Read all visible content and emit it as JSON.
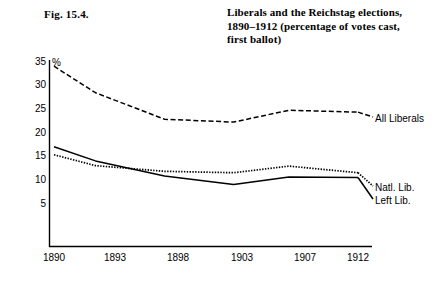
{
  "figure": {
    "number": "Fig. 15.4.",
    "title_lines": [
      "Liberals and the Reichstag elections,",
      "1890–1912 (percentage of votes cast,",
      "first ballot)"
    ]
  },
  "chart_data": {
    "type": "line",
    "title": "Liberals and the Reichstag elections, 1890–1912 (percentage of votes cast, first ballot)",
    "xlabel": "",
    "ylabel": "%",
    "categories": [
      "1890",
      "1893",
      "1898",
      "1903",
      "1907",
      "1912"
    ],
    "x": [
      1890,
      1893,
      1898,
      1903,
      1907,
      1912
    ],
    "ylim": [
      0,
      36
    ],
    "xlim": [
      1888.5,
      1913.5
    ],
    "yticks": [
      5,
      10,
      15,
      20,
      25,
      30,
      35
    ],
    "ytick_labels": [
      "5",
      "10",
      "15",
      "20",
      "25",
      "30",
      "35"
    ],
    "xtick_labels": [
      "1890",
      "1893",
      "1898",
      "1903",
      "1907",
      "1912"
    ],
    "grid": false,
    "legend_position": "right-inline",
    "series": [
      {
        "name": "All Liberals",
        "style": "dashed",
        "color": "#000000",
        "values": [
          34.0,
          28.4,
          22.8,
          22.2,
          24.7,
          24.3
        ]
      },
      {
        "name": "Natl. Lib.",
        "style": "dotted",
        "color": "#000000",
        "values": [
          15.3,
          13.0,
          11.8,
          11.5,
          12.9,
          11.5
        ]
      },
      {
        "name": "Left Lib.",
        "style": "solid",
        "color": "#000000",
        "values": [
          17.0,
          14.0,
          10.8,
          9.0,
          10.6,
          10.5
        ]
      }
    ]
  },
  "axis": {
    "y_unit": "%",
    "y_ticks": [
      "35",
      "30",
      "25",
      "20",
      "15",
      "10",
      "5"
    ],
    "x_ticks": [
      "1890",
      "1893",
      "1898",
      "1903",
      "1907",
      "1912"
    ]
  },
  "legend": {
    "items": [
      {
        "label": "All Liberals",
        "style": "dashed"
      },
      {
        "label": "Natl. Lib.",
        "style": "dotted"
      },
      {
        "label": "Left Lib.",
        "style": "solid"
      }
    ]
  },
  "colors": {
    "ink": "#000000",
    "background": "#ffffff"
  }
}
